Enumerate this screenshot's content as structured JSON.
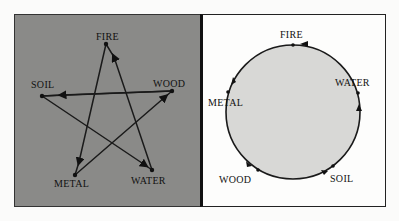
{
  "diagram": {
    "left_panel": {
      "title": "Controlling cycle (pentagram)",
      "background": "#8a8a88",
      "nodes": [
        {
          "id": "fire",
          "label": "FIRE",
          "x": 106,
          "y": 44
        },
        {
          "id": "wood",
          "label": "WOOD",
          "x": 172,
          "y": 91
        },
        {
          "id": "water",
          "label": "WATER",
          "x": 152,
          "y": 170
        },
        {
          "id": "metal",
          "label": "METAL",
          "x": 75,
          "y": 175
        },
        {
          "id": "soil",
          "label": "SOIL",
          "x": 42,
          "y": 96
        }
      ],
      "edges": [
        {
          "from": "wood",
          "to": "soil"
        },
        {
          "from": "soil",
          "to": "water"
        },
        {
          "from": "water",
          "to": "fire"
        },
        {
          "from": "fire",
          "to": "metal"
        },
        {
          "from": "metal",
          "to": "wood"
        }
      ]
    },
    "right_panel": {
      "title": "Generating cycle (circle)",
      "circle": {
        "cx": 293,
        "cy": 112,
        "r": 67,
        "fill": "#d8d8d6"
      },
      "nodes": [
        {
          "id": "fire",
          "label": "FIRE",
          "x": 294,
          "y": 45
        },
        {
          "id": "water",
          "label": "WATER",
          "x": 358,
          "y": 93
        },
        {
          "id": "soil",
          "label": "SOIL",
          "x": 334,
          "y": 166
        },
        {
          "id": "wood",
          "label": "WOOD",
          "x": 258,
          "y": 170
        },
        {
          "id": "metal",
          "label": "METAL",
          "x": 228,
          "y": 92
        }
      ]
    }
  }
}
